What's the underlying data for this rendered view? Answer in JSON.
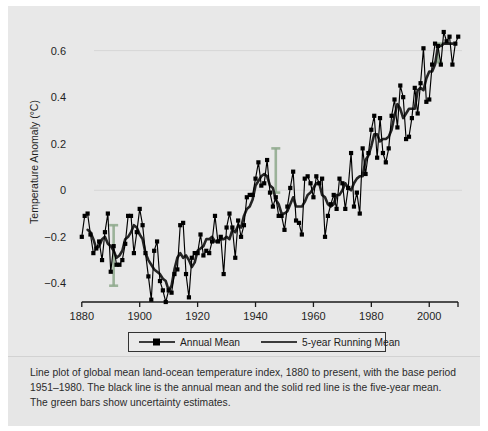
{
  "figure": {
    "background_color": "#e8e8e8",
    "caption": "Line plot of global mean land-ocean temperature index, 1880 to present, with the base period 1951–1980. The black line is the annual mean and the solid red line is the five-year mean. The green bars show uncertainty estimates."
  },
  "chart_data": {
    "type": "line",
    "title": "",
    "xlabel": "",
    "ylabel": "Temperature Anomaly (°C)",
    "xlim": [
      1878,
      2012
    ],
    "ylim": [
      -0.48,
      0.68
    ],
    "xticks": [
      1880,
      1900,
      1920,
      1940,
      1960,
      1980,
      2000
    ],
    "yticks": [
      -0.4,
      -0.2,
      0,
      0.2,
      0.4,
      0.6
    ],
    "ytick_labels": [
      "−0.4",
      "−0.2",
      "0",
      "0.2",
      "0.4",
      "0.6"
    ],
    "xtick_labels": [
      "1880",
      "1900",
      "1920",
      "1940",
      "1960",
      "1980",
      "2000"
    ],
    "grid": false,
    "legend_position": "below-axes",
    "series": [
      {
        "name": "Annual Mean",
        "color": "#000000",
        "marker": "square",
        "x": [
          1880,
          1881,
          1882,
          1883,
          1884,
          1885,
          1886,
          1887,
          1888,
          1889,
          1890,
          1891,
          1892,
          1893,
          1894,
          1895,
          1896,
          1897,
          1898,
          1899,
          1900,
          1901,
          1902,
          1903,
          1904,
          1905,
          1906,
          1907,
          1908,
          1909,
          1910,
          1911,
          1912,
          1913,
          1914,
          1915,
          1916,
          1917,
          1918,
          1919,
          1920,
          1921,
          1922,
          1923,
          1924,
          1925,
          1926,
          1927,
          1928,
          1929,
          1930,
          1931,
          1932,
          1933,
          1934,
          1935,
          1936,
          1937,
          1938,
          1939,
          1940,
          1941,
          1942,
          1943,
          1944,
          1945,
          1946,
          1947,
          1948,
          1949,
          1950,
          1951,
          1952,
          1953,
          1954,
          1955,
          1956,
          1957,
          1958,
          1959,
          1960,
          1961,
          1962,
          1963,
          1964,
          1965,
          1966,
          1967,
          1968,
          1969,
          1970,
          1971,
          1972,
          1973,
          1974,
          1975,
          1976,
          1977,
          1978,
          1979,
          1980,
          1981,
          1982,
          1983,
          1984,
          1985,
          1986,
          1987,
          1988,
          1989,
          1990,
          1991,
          1992,
          1993,
          1994,
          1995,
          1996,
          1997,
          1998,
          1999,
          2000,
          2001,
          2002,
          2003,
          2004,
          2005,
          2006,
          2007,
          2008,
          2009,
          2010
        ],
        "values": [
          -0.2,
          -0.11,
          -0.1,
          -0.19,
          -0.27,
          -0.25,
          -0.22,
          -0.3,
          -0.18,
          -0.1,
          -0.35,
          -0.24,
          -0.32,
          -0.32,
          -0.3,
          -0.23,
          -0.11,
          -0.11,
          -0.27,
          -0.18,
          -0.08,
          -0.15,
          -0.27,
          -0.37,
          -0.47,
          -0.26,
          -0.22,
          -0.39,
          -0.43,
          -0.48,
          -0.43,
          -0.44,
          -0.36,
          -0.34,
          -0.15,
          -0.14,
          -0.36,
          -0.46,
          -0.29,
          -0.27,
          -0.27,
          -0.19,
          -0.28,
          -0.26,
          -0.27,
          -0.22,
          -0.11,
          -0.22,
          -0.2,
          -0.36,
          -0.16,
          -0.1,
          -0.16,
          -0.29,
          -0.13,
          -0.2,
          -0.15,
          -0.03,
          -0.02,
          -0.02,
          0.05,
          0.12,
          0.02,
          0.03,
          0.13,
          -0.01,
          -0.07,
          -0.03,
          -0.11,
          -0.11,
          -0.17,
          -0.07,
          0.01,
          0.08,
          -0.13,
          -0.14,
          -0.19,
          0.05,
          0.06,
          0.03,
          -0.03,
          0.06,
          0.03,
          0.05,
          -0.2,
          -0.11,
          -0.06,
          -0.02,
          -0.08,
          0.05,
          0.03,
          -0.08,
          0.01,
          0.16,
          -0.07,
          -0.01,
          -0.1,
          0.18,
          0.07,
          0.16,
          0.26,
          0.32,
          0.14,
          0.31,
          0.16,
          0.12,
          0.18,
          0.32,
          0.39,
          0.27,
          0.45,
          0.4,
          0.22,
          0.23,
          0.31,
          0.44,
          0.33,
          0.46,
          0.61,
          0.38,
          0.39,
          0.54,
          0.63,
          0.62,
          0.54,
          0.68,
          0.64,
          0.66,
          0.54,
          0.63,
          0.66
        ]
      },
      {
        "name": "5-year Running Mean",
        "color": "#c0392b",
        "marker": "none",
        "x": [
          1882,
          1883,
          1884,
          1885,
          1886,
          1887,
          1888,
          1889,
          1890,
          1891,
          1892,
          1893,
          1894,
          1895,
          1896,
          1897,
          1898,
          1899,
          1900,
          1901,
          1902,
          1903,
          1904,
          1905,
          1906,
          1907,
          1908,
          1909,
          1910,
          1911,
          1912,
          1913,
          1914,
          1915,
          1916,
          1917,
          1918,
          1919,
          1920,
          1921,
          1922,
          1923,
          1924,
          1925,
          1926,
          1927,
          1928,
          1929,
          1930,
          1931,
          1932,
          1933,
          1934,
          1935,
          1936,
          1937,
          1938,
          1939,
          1940,
          1941,
          1942,
          1943,
          1944,
          1945,
          1946,
          1947,
          1948,
          1949,
          1950,
          1951,
          1952,
          1953,
          1954,
          1955,
          1956,
          1957,
          1958,
          1959,
          1960,
          1961,
          1962,
          1963,
          1964,
          1965,
          1966,
          1967,
          1968,
          1969,
          1970,
          1971,
          1972,
          1973,
          1974,
          1975,
          1976,
          1977,
          1978,
          1979,
          1980,
          1981,
          1982,
          1983,
          1984,
          1985,
          1986,
          1987,
          1988,
          1989,
          1990,
          1991,
          1992,
          1993,
          1994,
          1995,
          1996,
          1997,
          1998,
          1999,
          2000,
          2001,
          2002,
          2003,
          2004,
          2005,
          2006,
          2007,
          2008
        ],
        "values": [
          -0.17,
          -0.18,
          -0.21,
          -0.25,
          -0.24,
          -0.21,
          -0.2,
          -0.23,
          -0.24,
          -0.26,
          -0.29,
          -0.28,
          -0.26,
          -0.21,
          -0.2,
          -0.18,
          -0.15,
          -0.16,
          -0.19,
          -0.21,
          -0.27,
          -0.3,
          -0.32,
          -0.34,
          -0.35,
          -0.36,
          -0.38,
          -0.39,
          -0.43,
          -0.41,
          -0.34,
          -0.29,
          -0.27,
          -0.29,
          -0.28,
          -0.3,
          -0.33,
          -0.31,
          -0.26,
          -0.25,
          -0.24,
          -0.21,
          -0.21,
          -0.2,
          -0.22,
          -0.22,
          -0.21,
          -0.21,
          -0.2,
          -0.21,
          -0.17,
          -0.18,
          -0.15,
          -0.16,
          -0.11,
          -0.08,
          -0.07,
          -0.04,
          0.02,
          0.04,
          0.06,
          0.07,
          0.06,
          0.02,
          0.01,
          -0.04,
          -0.06,
          -0.1,
          -0.1,
          -0.09,
          -0.06,
          -0.03,
          -0.07,
          -0.07,
          -0.07,
          -0.05,
          -0.02,
          -0.01,
          0.01,
          0.03,
          0.03,
          -0.02,
          -0.03,
          -0.06,
          -0.07,
          -0.06,
          -0.02,
          -0.02,
          0.0,
          0.03,
          0.01,
          0.0,
          0.03,
          0.05,
          0.06,
          0.06,
          0.13,
          0.15,
          0.19,
          0.24,
          0.24,
          0.21,
          0.22,
          0.22,
          0.23,
          0.26,
          0.32,
          0.37,
          0.35,
          0.31,
          0.33,
          0.35,
          0.35,
          0.35,
          0.43,
          0.44,
          0.43,
          0.48,
          0.51,
          0.51,
          0.54,
          0.62,
          0.62,
          0.63,
          0.63,
          0.63,
          0.63
        ]
      }
    ],
    "uncertainty_bars": {
      "name": "uncertainty estimates",
      "color": "#8ea98c",
      "bars": [
        {
          "x": 1891,
          "low": -0.41,
          "high": -0.15
        },
        {
          "x": 1947,
          "low": -0.01,
          "high": 0.18
        },
        {
          "x": 2003,
          "low": 0.55,
          "high": 0.63
        }
      ]
    }
  },
  "legend": {
    "entries": [
      {
        "label": "Annual Mean",
        "color": "#000000",
        "marker": "square"
      },
      {
        "label": "5-year Running Mean",
        "color": "#c0392b",
        "marker": "none"
      }
    ]
  }
}
